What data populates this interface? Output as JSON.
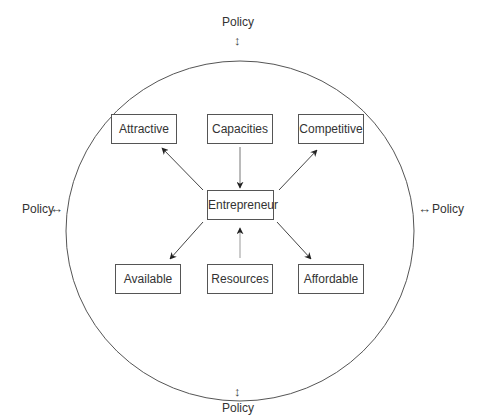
{
  "diagram": {
    "ellipse": {
      "cx": 240,
      "cy": 231,
      "rx": 174,
      "ry": 170
    },
    "policy": {
      "top": {
        "label": "Policy",
        "glyph": "↕"
      },
      "bottom": {
        "label": "Policy",
        "glyph": "↕"
      },
      "left": {
        "label": "Policy",
        "glyph": "↔"
      },
      "right": {
        "label": "Policy",
        "glyph": "↔"
      }
    },
    "nodes": {
      "attractive": "Attractive",
      "capacities": "Capacities",
      "competitive": "Competitive",
      "entrepreneur": "Entrepreneur",
      "available": "Available",
      "resources": "Resources",
      "affordable": "Affordable"
    },
    "edges": [
      {
        "from": "Entrepreneur",
        "to": "Attractive"
      },
      {
        "from": "Capacities",
        "to": "Entrepreneur"
      },
      {
        "from": "Entrepreneur",
        "to": "Competitive"
      },
      {
        "from": "Entrepreneur",
        "to": "Available"
      },
      {
        "from": "Resources",
        "to": "Entrepreneur"
      },
      {
        "from": "Entrepreneur",
        "to": "Affordable"
      }
    ],
    "colors": {
      "line": "#444444",
      "text": "#333333",
      "background": "#ffffff"
    }
  }
}
